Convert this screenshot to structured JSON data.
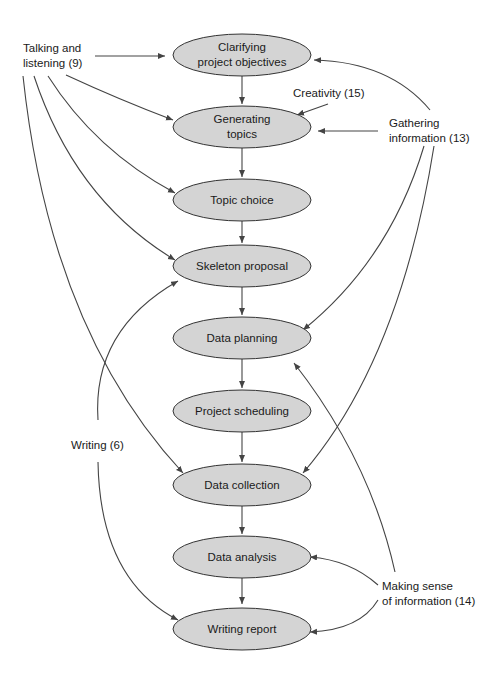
{
  "diagram": {
    "nodes": [
      {
        "id": "n1",
        "lines": [
          "Clarifying",
          "project objectives"
        ]
      },
      {
        "id": "n2",
        "lines": [
          "Generating",
          "topics"
        ]
      },
      {
        "id": "n3",
        "lines": [
          "Topic choice"
        ]
      },
      {
        "id": "n4",
        "lines": [
          "Skeleton proposal"
        ]
      },
      {
        "id": "n5",
        "lines": [
          "Data planning"
        ]
      },
      {
        "id": "n6",
        "lines": [
          "Project scheduling"
        ]
      },
      {
        "id": "n7",
        "lines": [
          "Data collection"
        ]
      },
      {
        "id": "n8",
        "lines": [
          "Data analysis"
        ]
      },
      {
        "id": "n9",
        "lines": [
          "Writing report"
        ]
      }
    ],
    "skills": {
      "talking": {
        "lines": [
          "Talking and",
          "listening (9)"
        ]
      },
      "creativity": {
        "lines": [
          "Creativity (15)"
        ]
      },
      "gathering": {
        "lines": [
          "Gathering",
          "information (13)"
        ]
      },
      "writing": {
        "lines": [
          "Writing (6)"
        ]
      },
      "sense": {
        "lines": [
          "Making sense",
          "of information (14)"
        ]
      }
    },
    "colors": {
      "node_fill": "#d4d4d4",
      "stroke": "#333333",
      "text": "#1a1a1a"
    }
  }
}
